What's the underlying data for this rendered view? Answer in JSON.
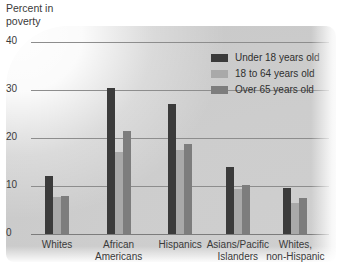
{
  "chart_data": {
    "type": "bar",
    "title": "Percent in poverty",
    "xlabel": "",
    "ylabel": "Percent in poverty",
    "ylim": [
      0,
      40
    ],
    "yticks": [
      0,
      10,
      20,
      30,
      40
    ],
    "grid": true,
    "legend_position": "top-right",
    "categories": [
      "Whites",
      "African Americans",
      "Hispanics",
      "Asians/Pacific Islanders",
      "Whites, non-Hispanic"
    ],
    "series": [
      {
        "name": "Under 18 years old",
        "color": "#3b3b3b",
        "values": [
          12.0,
          30.5,
          27.0,
          14.0,
          9.5
        ]
      },
      {
        "name": "18 to 64 years old",
        "color": "#a9a9a9",
        "values": [
          7.7,
          17.0,
          17.5,
          9.3,
          6.5
        ]
      },
      {
        "name": "Over 65 years old",
        "color": "#7d7d7d",
        "values": [
          8.0,
          21.5,
          18.7,
          10.3,
          7.5
        ]
      }
    ]
  },
  "axis": {
    "title_text": "Percent in\npoverty"
  },
  "xtick_labels": [
    "Whites",
    "African\nAmericans",
    "Hispanics",
    "Asians/Pacific\nIslanders",
    "Whites,\nnon-Hispanic"
  ],
  "ytick_labels": [
    "40",
    "30",
    "20",
    "10",
    "0"
  ],
  "legend": {
    "items": [
      {
        "label": "Under 18 years old"
      },
      {
        "label": "18 to 64 years old"
      },
      {
        "label": "Over 65 years old"
      }
    ]
  }
}
